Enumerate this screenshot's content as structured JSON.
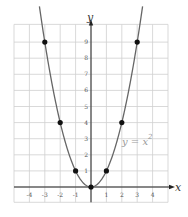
{
  "chart_data": {
    "type": "line",
    "title": "",
    "xlabel": "x",
    "ylabel": "y",
    "xlim": [
      -5,
      5
    ],
    "ylim": [
      -1,
      10
    ],
    "grid": true,
    "x_ticks": [
      "-4",
      "-3",
      "-2",
      "-1",
      "1",
      "2",
      "3",
      "4"
    ],
    "y_ticks": [
      "1",
      "2",
      "3",
      "4",
      "5",
      "6",
      "7",
      "8",
      "9"
    ],
    "annotation": {
      "text": "y = x",
      "superscript": "2",
      "x": 2.1,
      "y": 2.6
    },
    "series": [
      {
        "name": "y = x^2",
        "function": "x^2",
        "color": "#666666",
        "points": [
          {
            "x": -3,
            "y": 9
          },
          {
            "x": -2,
            "y": 4
          },
          {
            "x": -1,
            "y": 1
          },
          {
            "x": 0,
            "y": 0
          },
          {
            "x": 1,
            "y": 1
          },
          {
            "x": 2,
            "y": 4
          },
          {
            "x": 3,
            "y": 9
          }
        ]
      }
    ]
  },
  "labels": {
    "x_axis": "x",
    "y_axis": "y",
    "equation": "y = x",
    "equation_exp": "2"
  },
  "colors": {
    "grid": "#cfcfcf",
    "axis": "#222222",
    "curve": "#666666",
    "point": "#111111"
  }
}
